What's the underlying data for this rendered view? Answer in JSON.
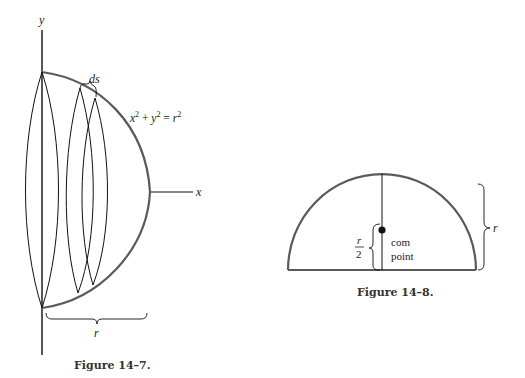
{
  "figures": [
    {
      "id": "fig-14-7",
      "caption": "Figure 14–7.",
      "labels": {
        "y_axis": "y",
        "x_axis": "x",
        "arc_element": "ds",
        "equation_lhs_x": "x",
        "equation_sup1": "2",
        "equation_plus": " + ",
        "equation_lhs_y": "y",
        "equation_sup2": "2",
        "equation_eq": " = ",
        "equation_rhs": "r",
        "equation_sup3": "2",
        "radius": "r"
      }
    },
    {
      "id": "fig-14-8",
      "caption": "Figure 14–8.",
      "labels": {
        "half_height_num": "r",
        "half_height_den": "2",
        "com_line1": "com",
        "com_line2": "point",
        "radius": "r"
      }
    }
  ],
  "colors": {
    "arc": "#5a5a5a",
    "line": "#111111",
    "text": "#222222"
  }
}
